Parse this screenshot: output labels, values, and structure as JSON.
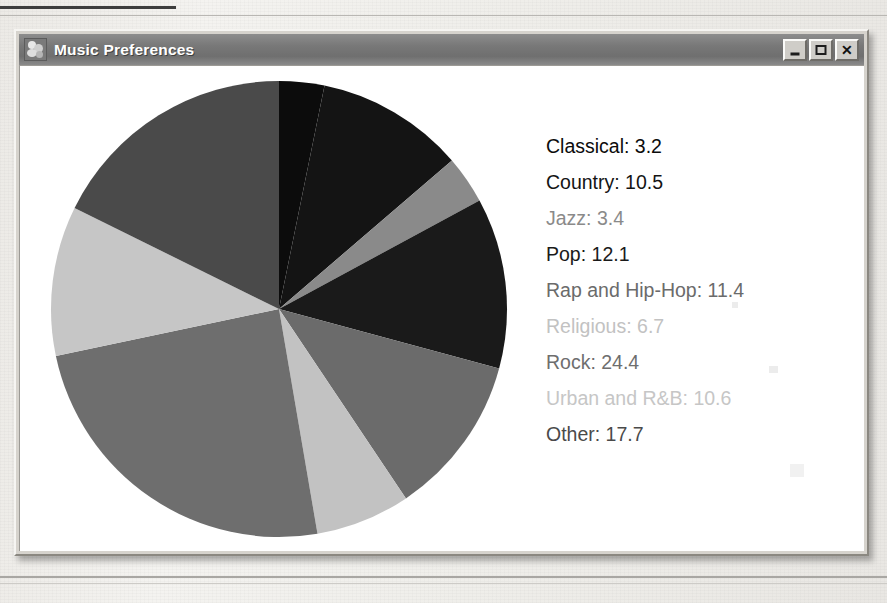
{
  "window": {
    "title": "Music Preferences",
    "icon": "app-music-icon",
    "controls": [
      {
        "name": "minimize",
        "glyph": "_"
      },
      {
        "name": "maximize",
        "glyph": "□"
      },
      {
        "name": "close",
        "glyph": "✕"
      }
    ]
  },
  "legend": {
    "entries": [
      {
        "label": "Classical: 3.2",
        "color": "#0c0c0c"
      },
      {
        "label": "Country: 10.5",
        "color": "#141414"
      },
      {
        "label": "Jazz: 3.4",
        "color": "#8a8a8a"
      },
      {
        "label": "Pop: 12.1",
        "color": "#1a1a1a"
      },
      {
        "label": "Rap and Hip-Hop: 11.4",
        "color": "#6b6b6b"
      },
      {
        "label": "Religious: 6.7",
        "color": "#c2c2c2"
      },
      {
        "label": "Rock: 24.4",
        "color": "#6e6e6e"
      },
      {
        "label": "Urban and R&B: 10.6",
        "color": "#c6c6c6"
      },
      {
        "label": "Other: 17.7",
        "color": "#4a4a4a"
      }
    ]
  },
  "chart_data": {
    "type": "pie",
    "title": "Music Preferences",
    "unit": "percent",
    "start_angle_deg": 90,
    "direction": "clockwise",
    "categories": [
      "Classical",
      "Country",
      "Jazz",
      "Pop",
      "Rap and Hip-Hop",
      "Religious",
      "Rock",
      "Urban and R&B",
      "Other"
    ],
    "values": [
      3.2,
      10.5,
      3.4,
      12.1,
      11.4,
      6.7,
      24.4,
      10.6,
      17.7
    ],
    "colors": [
      "#0c0c0c",
      "#141414",
      "#8a8a8a",
      "#1a1a1a",
      "#6b6b6b",
      "#c2c2c2",
      "#6e6e6e",
      "#c6c6c6",
      "#4a4a4a"
    ],
    "total": 100.0,
    "legend_position": "right",
    "grid": false
  }
}
